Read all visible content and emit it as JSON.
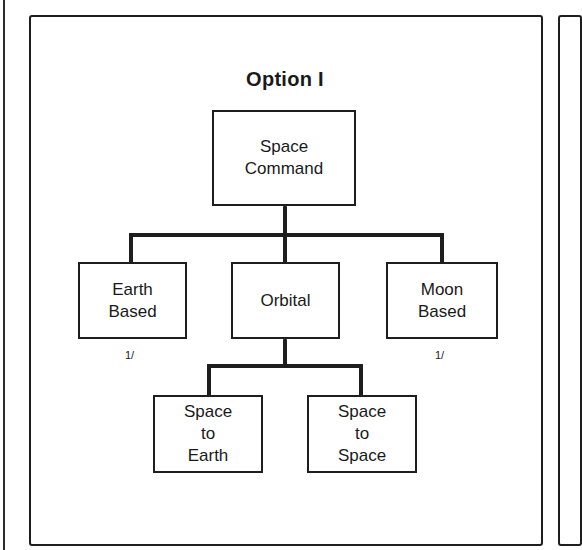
{
  "diagram": {
    "title": "Option I",
    "root": {
      "lines": [
        "Space",
        "Command"
      ]
    },
    "level1": [
      {
        "lines": [
          "Earth",
          "Based"
        ],
        "footnote": "1/"
      },
      {
        "lines": [
          "Orbital"
        ],
        "footnote": ""
      },
      {
        "lines": [
          "Moon",
          "Based"
        ],
        "footnote": "1/"
      }
    ],
    "level2": [
      {
        "lines": [
          "Space",
          "to",
          "Earth"
        ]
      },
      {
        "lines": [
          "Space",
          "to",
          "Space"
        ]
      }
    ],
    "colors": {
      "line": "#1e1e1e",
      "background": "#ffffff"
    }
  }
}
